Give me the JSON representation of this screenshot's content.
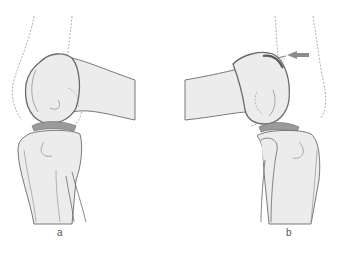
{
  "panels": [
    {
      "id": "a",
      "label": "a",
      "description": "knee joint lateral view, femur extending right"
    },
    {
      "id": "b",
      "label": "b",
      "description": "knee joint lateral view, femur extending left, with arrow indicating posterior condyle"
    }
  ],
  "colors": {
    "bone_fill": "#ebebeb",
    "bone_outline": "#6a6a6a",
    "cartilage": "#8a8a8a",
    "meniscus": "#9a9a9a",
    "dashed_outline": "#9a9a9a",
    "arrow": "#8c8c8c"
  },
  "annotations": {
    "arrow_direction": "left"
  }
}
